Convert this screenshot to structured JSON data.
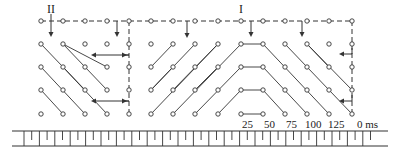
{
  "figure": {
    "labels": {
      "wave_I": "I",
      "wave_II": "II"
    },
    "time_axis": {
      "unit_label": "0 ms",
      "tick_labels": [
        "25",
        "50",
        "75",
        "100",
        "125"
      ]
    }
  },
  "grid": {
    "columns_x": [
      41,
      63,
      85,
      107,
      129,
      151,
      173,
      195,
      218,
      241,
      263,
      285,
      307,
      329,
      352
    ],
    "rows_y": [
      21,
      44,
      67,
      90,
      114
    ]
  },
  "colors": {
    "ink": "#333333",
    "background": "#ffffff"
  }
}
